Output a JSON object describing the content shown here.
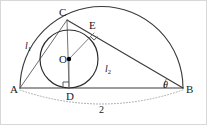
{
  "figure": {
    "type": "geometry-diagram",
    "width": 208,
    "height": 126,
    "background_color": "#ffffff",
    "stroke_color": "#333333",
    "dot_color": "#000000",
    "dotted_color": "#808080"
  },
  "points": {
    "A": {
      "label": "A",
      "x": 20,
      "y": 88,
      "label_x": 10,
      "label_y": 84
    },
    "B": {
      "label": "B",
      "x": 183,
      "y": 88,
      "label_x": 186,
      "label_y": 84
    },
    "C": {
      "label": "C",
      "x": 67,
      "y": 20,
      "label_x": 59,
      "label_y": 7
    },
    "D": {
      "label": "D",
      "x": 69,
      "y": 88,
      "label_x": 69,
      "label_y": 91
    },
    "E": {
      "label": "E",
      "x": 94,
      "y": 33,
      "label_x": 89,
      "label_y": 20
    },
    "O": {
      "label": "O",
      "x": 69,
      "y": 59,
      "label_x": 59,
      "label_y": 54
    }
  },
  "circles": {
    "semicircle": {
      "cx": 101.5,
      "cy": 88,
      "r": 81.5,
      "name": "semicircle-on-AB"
    },
    "incircle": {
      "cx": 69,
      "cy": 59,
      "r": 29,
      "name": "inscribed-circle"
    }
  },
  "segments": [
    {
      "name": "segment-AB",
      "from": "A",
      "to": "B"
    },
    {
      "name": "segment-AC",
      "from": "A",
      "to": "C"
    },
    {
      "name": "segment-CB",
      "from": "C",
      "to": "B"
    },
    {
      "name": "segment-CD",
      "from": "C",
      "to": "D"
    },
    {
      "name": "segment-OD",
      "from": "O",
      "to": "D"
    },
    {
      "name": "segment-OE",
      "from": "O",
      "to": "E"
    }
  ],
  "labels": {
    "side_l1": {
      "text": "l",
      "sub": "1",
      "x": 25,
      "y": 41
    },
    "side_l2": {
      "text": "l",
      "sub": "2",
      "x": 105,
      "y": 64
    },
    "angle_theta": {
      "text": "θ",
      "x": 163,
      "y": 80
    },
    "diameter": {
      "text": "2",
      "x": 99,
      "y": 105
    }
  },
  "marks": {
    "right_angle_at_D": {
      "name": "right-angle-mark-D",
      "x": 69,
      "y": 88,
      "size": 6
    },
    "right_angle_at_E": {
      "name": "right-angle-mark-E",
      "x": 94,
      "y": 33,
      "size": 5
    },
    "center_dot_O": {
      "name": "center-dot",
      "x": 69,
      "y": 59,
      "r": 2.2
    },
    "dotted_arc": {
      "name": "dotted-measure-arc",
      "from_x": 20,
      "from_y": 90,
      "to_x": 183,
      "to_y": 90,
      "sag": 28
    }
  }
}
